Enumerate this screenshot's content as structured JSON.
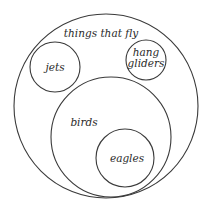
{
  "diagram": {
    "type": "euler-diagram",
    "stroke_color": "#3a3a3a",
    "text_color": "#2a2a2a",
    "background": "#ffffff",
    "sets": [
      {
        "id": "things-that-fly",
        "label": "things that fly",
        "circle": {
          "cx": 106,
          "cy": 106,
          "r": 92
        },
        "label_pos": {
          "x": 101,
          "y": 37
        }
      },
      {
        "id": "jets",
        "label": "jets",
        "circle": {
          "cx": 55,
          "cy": 67,
          "r": 25
        },
        "label_pos": {
          "x": 55,
          "y": 71
        }
      },
      {
        "id": "hang-gliders",
        "label_line1": "hang",
        "label_line2": "gliders",
        "circle": {
          "cx": 146,
          "cy": 60,
          "r": 20
        },
        "label_pos_line1": {
          "x": 146,
          "y": 56
        },
        "label_pos_line2": {
          "x": 146,
          "y": 67
        }
      },
      {
        "id": "birds",
        "label": "birds",
        "circle": {
          "cx": 111,
          "cy": 137,
          "r": 60
        },
        "label_pos": {
          "x": 84,
          "y": 126
        }
      },
      {
        "id": "eagles",
        "label": "eagles",
        "circle": {
          "cx": 125,
          "cy": 158,
          "r": 29
        },
        "label_pos": {
          "x": 127,
          "y": 162
        }
      }
    ],
    "relations": [
      {
        "subset": "jets",
        "of": "things that fly"
      },
      {
        "subset": "hang gliders",
        "of": "things that fly"
      },
      {
        "subset": "birds",
        "of": "things that fly"
      },
      {
        "subset": "eagles",
        "of": "birds"
      }
    ]
  }
}
